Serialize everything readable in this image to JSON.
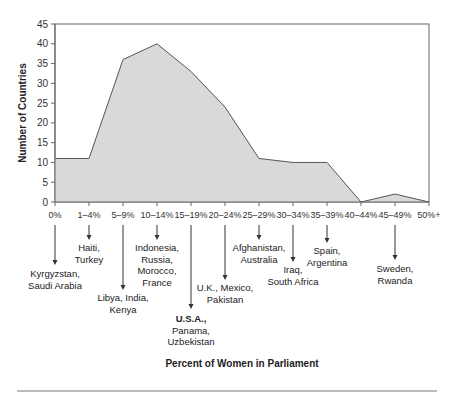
{
  "chart_data": {
    "type": "area",
    "title": "",
    "xlabel": "Percent of Women in Parliament",
    "ylabel": "Number of Countries",
    "ylim": [
      0,
      45
    ],
    "yticks": [
      0,
      5,
      10,
      15,
      20,
      25,
      30,
      35,
      40,
      45
    ],
    "grid": false,
    "legend": null,
    "categories": [
      "0%",
      "1–4%",
      "5–9%",
      "10–14%",
      "15–19%",
      "20–24%",
      "25–29%",
      "30–34%",
      "35–39%",
      "40–44%",
      "45–49%",
      "50%+"
    ],
    "values": [
      11,
      11,
      36,
      40,
      33,
      24,
      11,
      10,
      10,
      0,
      2,
      0
    ],
    "colors": {
      "fill": "#d9d9d9",
      "line": "#555555",
      "axis": "#666666"
    },
    "annotations": [
      {
        "category": "0%",
        "lines": [
          "Kyrgyzstan,",
          "Saudi Arabia"
        ],
        "bold_first": false,
        "arrow_end": 265,
        "text_y": 277
      },
      {
        "category": "1–4%",
        "lines": [
          "Haiti,",
          "Turkey"
        ],
        "bold_first": false,
        "arrow_end": 240,
        "text_y": 251
      },
      {
        "category": "5–9%",
        "lines": [
          "Libya, India,",
          "Kenya"
        ],
        "bold_first": false,
        "arrow_end": 290,
        "text_y": 301
      },
      {
        "category": "10–14%",
        "lines": [
          "Indonesia,",
          "Russia,",
          "Morocco,",
          "France"
        ],
        "bold_first": false,
        "arrow_end": 240,
        "text_y": 251
      },
      {
        "category": "15–19%",
        "lines": [
          "U.S.A.,",
          "Panama,",
          "Uzbekistan"
        ],
        "bold_first": true,
        "arrow_end": 309,
        "text_y": 322
      },
      {
        "category": "20–24%",
        "lines": [
          "U.K., Mexico,",
          "Pakistan"
        ],
        "bold_first": false,
        "arrow_end": 280,
        "text_y": 291
      },
      {
        "category": "25–29%",
        "lines": [
          "Afghanistan,",
          "Australia"
        ],
        "bold_first": false,
        "arrow_end": 240,
        "text_y": 251
      },
      {
        "category": "30–34%",
        "lines": [
          "Iraq,",
          "South Africa"
        ],
        "bold_first": false,
        "arrow_end": 262,
        "text_y": 273
      },
      {
        "category": "35–39%",
        "lines": [
          "Spain,",
          "Argentina"
        ],
        "bold_first": false,
        "arrow_end": 243,
        "text_y": 254
      },
      {
        "category": "45–49%",
        "lines": [
          "Sweden,",
          "Rwanda"
        ],
        "bold_first": false,
        "arrow_end": 260,
        "text_y": 272
      }
    ]
  }
}
